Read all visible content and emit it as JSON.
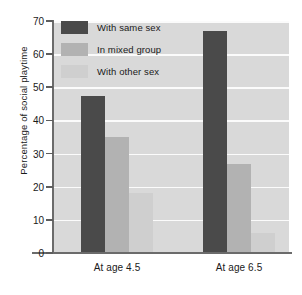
{
  "chart_data": {
    "type": "bar",
    "title": "",
    "xlabel": "",
    "ylabel": "Percentage of social playtime",
    "categories": [
      "At age 4.5",
      "At age 6.5"
    ],
    "ylim": [
      0,
      70
    ],
    "ytick_step": 10,
    "yticks": [
      0,
      10,
      20,
      30,
      40,
      50,
      60,
      70
    ],
    "ytick_labels": [
      "0",
      "10",
      "20",
      "30",
      "40",
      "50",
      "60",
      "70"
    ],
    "grid": "horizontal",
    "legend_position": "top-left-inside",
    "series": [
      {
        "name": "With same sex",
        "color": "#4a4a4a",
        "values": [
          47.5,
          67
        ]
      },
      {
        "name": "In mixed group",
        "color": "#b2b2b2",
        "values": [
          35,
          27
        ]
      },
      {
        "name": "With other sex",
        "color": "#cfcfcf",
        "values": [
          18,
          6
        ]
      }
    ]
  },
  "colors": {
    "plot_background": "#d9d9d9",
    "page_background": "#ffffff",
    "gridline": "#fbfbfb",
    "axis": "#6b6b6b",
    "text": "#1a1a1a"
  }
}
